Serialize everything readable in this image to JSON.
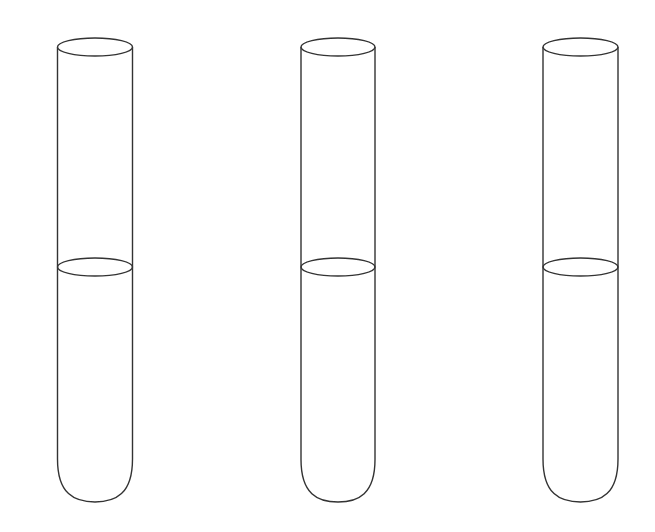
{
  "diagram": {
    "stroke_color": "#333333",
    "background": "#ffffff",
    "tubes": [
      {
        "id": "tube-1",
        "cx": 95,
        "top_y": 47,
        "liquid_y": 267,
        "bottom_y": 502,
        "rx": 37.5,
        "ry": 9
      },
      {
        "id": "tube-2",
        "cx": 338,
        "top_y": 47,
        "liquid_y": 267,
        "bottom_y": 502,
        "rx": 37,
        "ry": 9
      },
      {
        "id": "tube-3",
        "cx": 580.5,
        "top_y": 47,
        "liquid_y": 267,
        "bottom_y": 502,
        "rx": 37.5,
        "ry": 9
      }
    ]
  }
}
